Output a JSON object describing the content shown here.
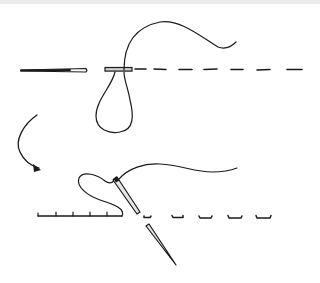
{
  "diagram": {
    "title": "",
    "colors": {
      "ink": "#1a1a1a",
      "background": "#ffffff",
      "top_band": "#ebebeb"
    },
    "steps": [
      {
        "id": "step-1",
        "description": "needle and thread pulled through fabric forming a loop",
        "elements": [
          "needle-horizontal",
          "fabric-stitch-line",
          "thread-loop",
          "thread-tail"
        ]
      },
      {
        "id": "step-2",
        "description": "needle inserted back through fabric behind previous stitch",
        "elements": [
          "needle-diagonal",
          "finished-stitches",
          "dashed-stitch-line",
          "thread-tail"
        ]
      }
    ],
    "connector": {
      "type": "curved-arrow",
      "from": "step-1",
      "to": "step-2"
    }
  }
}
